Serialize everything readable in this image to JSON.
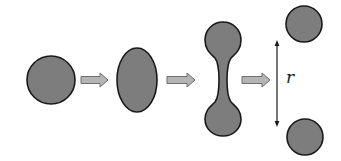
{
  "diagram": {
    "stages": [
      {
        "name": "sphere",
        "shape": "circle"
      },
      {
        "name": "elongated-ellipsoid",
        "shape": "ellipse"
      },
      {
        "name": "necked-dumbbell",
        "shape": "dumbbell"
      },
      {
        "name": "two-separated-droplets",
        "shape": "two-circles"
      }
    ],
    "arrows": [
      {
        "from": "sphere",
        "to": "elongated-ellipsoid"
      },
      {
        "from": "elongated-ellipsoid",
        "to": "necked-dumbbell"
      },
      {
        "from": "necked-dumbbell",
        "to": "two-separated-droplets"
      }
    ],
    "separation_label": "r",
    "colors": {
      "fill": "#7d7d7d",
      "stroke": "#1a1a1a",
      "arrow_fill": "#b4b4b4",
      "arrow_stroke": "#6e6e6e",
      "dimension_line": "#1a1a1a"
    }
  }
}
